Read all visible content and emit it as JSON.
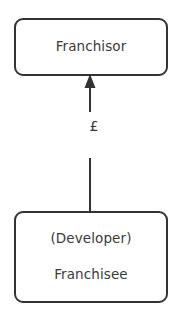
{
  "diagram": {
    "type": "flow-diagram",
    "background_color": "#ffffff",
    "stroke_color": "#333333",
    "text_color": "#3a3a3a",
    "nodes": [
      {
        "id": "franchisor",
        "label": "Franchisor",
        "shape": "rounded-rectangle",
        "position": "top"
      },
      {
        "id": "franchisee",
        "label_primary": "(Developer)",
        "label_secondary": "Franchisee",
        "shape": "rounded-rectangle",
        "position": "bottom"
      }
    ],
    "connector": {
      "id": "payment-flow",
      "from": "franchisee",
      "to": "franchisor",
      "direction": "upward",
      "arrowhead": "solid-triangle",
      "label": "£"
    }
  }
}
